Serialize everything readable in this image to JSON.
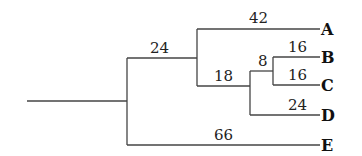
{
  "tree": {
    "leaves": [
      {
        "id": "A",
        "y": 29
      },
      {
        "id": "B",
        "y": 57
      },
      {
        "id": "C",
        "y": 85
      },
      {
        "id": "D",
        "y": 115
      },
      {
        "id": "E",
        "y": 145
      }
    ],
    "branch_labels": {
      "to_ABCD": "24",
      "to_A": "42",
      "to_BCD": "18",
      "to_BC": "8",
      "to_B": "16",
      "to_C": "16",
      "to_D": "24",
      "to_E": "66"
    }
  }
}
